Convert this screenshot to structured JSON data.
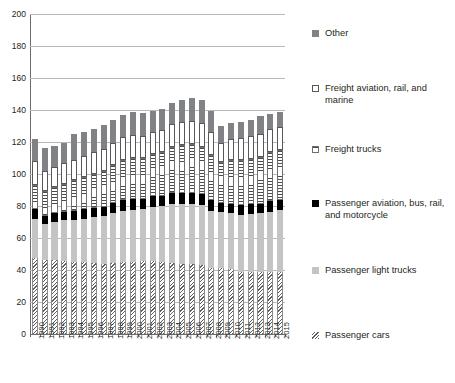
{
  "chart_data": {
    "type": "bar",
    "subtype": "stacked-bar",
    "title": "",
    "xlabel": "",
    "ylabel": "",
    "ylim": [
      0,
      200
    ],
    "y_ticks": [
      0,
      20,
      40,
      60,
      80,
      100,
      120,
      140,
      160,
      180,
      200
    ],
    "grid": true,
    "legend_position": "right",
    "categories": [
      "1990",
      "1991",
      "1992",
      "1993",
      "1994",
      "1995",
      "1996",
      "1997",
      "1998",
      "1999",
      "2000",
      "2001",
      "2002",
      "2003",
      "2004",
      "2005",
      "2006",
      "2007",
      "2008",
      "2009",
      "2010",
      "2011",
      "2012",
      "2013",
      "2014",
      "2015"
    ],
    "series": [
      {
        "name": "Passenger cars",
        "swatch": "hatch-diagonal",
        "color": "#ffffff",
        "values": [
          47.5,
          46.0,
          46.0,
          45.5,
          45.0,
          45.0,
          44.5,
          44.0,
          44.5,
          45.0,
          45.0,
          45.5,
          45.5,
          45.0,
          44.5,
          44.0,
          43.5,
          43.0,
          41.5,
          41.0,
          40.5,
          39.0,
          38.5,
          38.5,
          38.5,
          38.5
        ]
      },
      {
        "name": "Passenger light trucks",
        "swatch": "solid-light-gray",
        "color": "#c4c4c4",
        "values": [
          24.5,
          22.5,
          24.0,
          25.5,
          26.5,
          27.0,
          28.5,
          29.5,
          31.0,
          32.0,
          32.5,
          32.5,
          34.0,
          35.0,
          36.5,
          37.0,
          37.5,
          37.5,
          35.5,
          35.0,
          35.0,
          35.5,
          36.5,
          37.0,
          38.0,
          39.0
        ]
      },
      {
        "name": "Passenger aviation, bus, rail, and motorcycle",
        "swatch": "solid-black",
        "color": "#000000",
        "values": [
          6.0,
          5.5,
          5.5,
          5.5,
          5.5,
          6.0,
          6.0,
          6.0,
          6.5,
          6.5,
          7.0,
          6.5,
          6.5,
          6.5,
          7.0,
          7.0,
          7.0,
          7.0,
          6.5,
          6.0,
          6.0,
          6.0,
          6.0,
          6.0,
          6.5,
          6.5
        ]
      },
      {
        "name": "Freight trucks",
        "swatch": "hatch-horizontal",
        "color": "#ffffff",
        "values": [
          15.0,
          15.5,
          16.5,
          17.5,
          19.0,
          20.0,
          21.0,
          22.5,
          23.5,
          25.0,
          25.5,
          25.5,
          26.5,
          27.5,
          29.0,
          30.0,
          30.5,
          29.5,
          28.5,
          25.5,
          27.0,
          28.0,
          28.5,
          29.0,
          30.5,
          31.0
        ]
      },
      {
        "name": "Freight aviation, rail, and marine",
        "swatch": "white-outline",
        "color": "#ffffff",
        "values": [
          15.0,
          12.5,
          12.5,
          13.0,
          13.0,
          13.0,
          13.5,
          13.5,
          14.0,
          14.5,
          14.5,
          13.5,
          13.5,
          13.5,
          14.0,
          14.5,
          14.5,
          15.0,
          14.0,
          12.0,
          13.5,
          14.0,
          14.0,
          14.5,
          14.5,
          14.5
        ]
      },
      {
        "name": "Other",
        "swatch": "solid-gray",
        "color": "#808285",
        "values": [
          14.0,
          14.0,
          13.0,
          12.5,
          16.0,
          15.0,
          14.5,
          15.0,
          14.0,
          14.0,
          14.5,
          14.5,
          13.5,
          13.0,
          13.5,
          13.5,
          14.5,
          14.5,
          13.5,
          10.5,
          10.0,
          10.0,
          10.0,
          11.0,
          9.5,
          9.0
        ]
      }
    ],
    "totals": [
      122.0,
      116.0,
      117.5,
      119.5,
      125.0,
      126.0,
      128.0,
      130.5,
      133.5,
      137.0,
      139.0,
      138.0,
      139.5,
      140.5,
      144.5,
      146.0,
      147.5,
      146.5,
      139.5,
      130.0,
      132.0,
      132.5,
      133.5,
      136.0,
      137.5,
      138.5
    ]
  },
  "axes": {
    "y_tick_labels": [
      "200",
      "180",
      "160",
      "140",
      "120",
      "100",
      "80",
      "60",
      "40",
      "20",
      "0"
    ],
    "x_tick_labels": [
      "1990",
      "1991",
      "1992",
      "1993",
      "1994",
      "1995",
      "1996",
      "1997",
      "1998",
      "1999",
      "2000",
      "2001",
      "2002",
      "2003",
      "2004",
      "2005",
      "2006",
      "2007",
      "2008",
      "2009",
      "2010",
      "2011",
      "2012",
      "2013",
      "2014",
      "2015"
    ]
  },
  "legend": {
    "items": [
      {
        "label": "Other",
        "swatch_class": "sw-other",
        "icon": "solid-gray-square-icon",
        "top": 8
      },
      {
        "label": "Freight aviation, rail, and marine",
        "swatch_class": "sw-freightav",
        "icon": "white-outline-square-icon",
        "top": 63
      },
      {
        "label": "Freight trucks",
        "swatch_class": "sw-freighttrucks",
        "icon": "horizontal-hatch-square-icon",
        "top": 124
      },
      {
        "label": "Passenger aviation, bus, rail, and motorcycle",
        "swatch_class": "sw-paxav",
        "icon": "solid-black-square-icon",
        "top": 178
      },
      {
        "label": "Passenger light trucks",
        "swatch_class": "sw-lighttrucks",
        "icon": "solid-light-gray-square-icon",
        "top": 245
      },
      {
        "label": "Passenger cars",
        "swatch_class": "sw-cars",
        "icon": "diagonal-hatch-square-icon",
        "top": 310
      }
    ]
  }
}
